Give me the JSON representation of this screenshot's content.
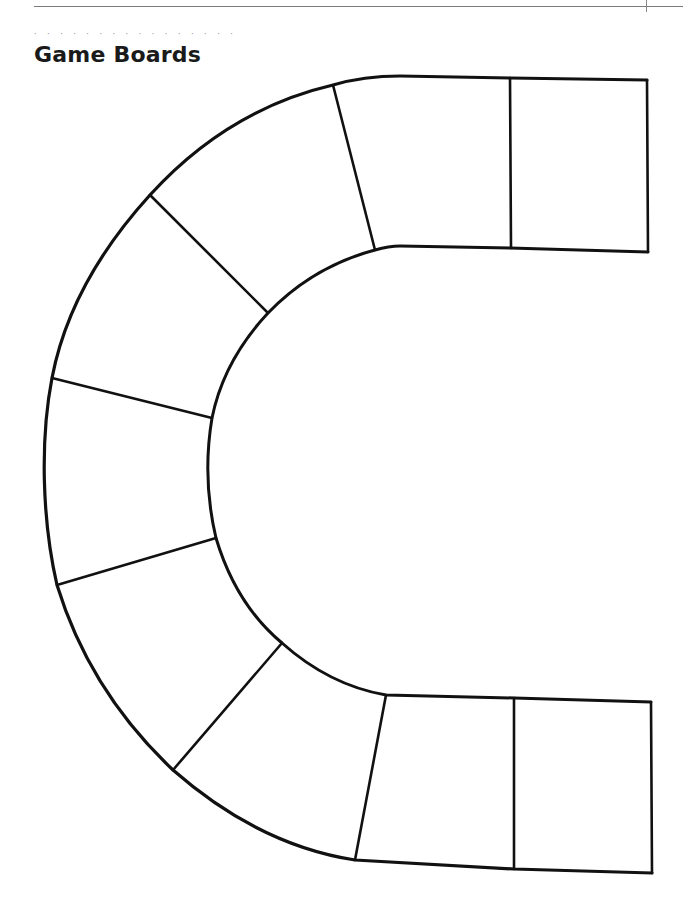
{
  "header": {
    "running_head": "APPENDIX",
    "page_number": "000"
  },
  "section": {
    "dots": "· · · · · · · · · · · · · · · ·",
    "title": "Game Boards"
  },
  "board": {
    "shape": "U-shaped path (horseshoe) opening to the right",
    "space_count": 10,
    "stroke_color": "#111111",
    "fill_color": "#ffffff",
    "spaces": [
      {
        "id": 1,
        "region": "top-right square"
      },
      {
        "id": 2,
        "region": "top second square"
      },
      {
        "id": 3,
        "region": "upper arc"
      },
      {
        "id": 4,
        "region": "upper-left arc"
      },
      {
        "id": 5,
        "region": "left-upper arc"
      },
      {
        "id": 6,
        "region": "left-lower arc"
      },
      {
        "id": 7,
        "region": "lower-left arc"
      },
      {
        "id": 8,
        "region": "lower arc"
      },
      {
        "id": 9,
        "region": "bottom second square"
      },
      {
        "id": 10,
        "region": "bottom-right square"
      }
    ]
  }
}
